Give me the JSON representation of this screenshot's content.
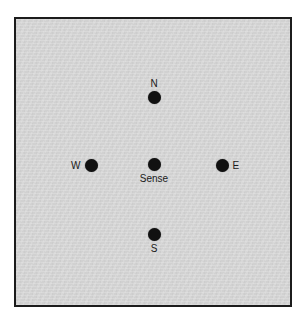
{
  "panel": {
    "background_color": "#d4d4d4",
    "border_color": "#1c1c1c",
    "page_color": "#ffffff"
  },
  "diagram": {
    "dot_color": "#111111",
    "label_color": "#1a1a1a",
    "nodes": [
      {
        "id": "north",
        "label": "N",
        "label_position": "above",
        "x": 152,
        "y": 95,
        "diameter": 13
      },
      {
        "id": "west",
        "label": "W",
        "label_position": "left",
        "x": 89,
        "y": 163,
        "diameter": 13
      },
      {
        "id": "sense",
        "label": "Sense",
        "label_position": "below",
        "x": 152,
        "y": 162,
        "diameter": 13
      },
      {
        "id": "east",
        "label": "E",
        "label_position": "right",
        "x": 220,
        "y": 163,
        "diameter": 13
      },
      {
        "id": "south",
        "label": "S",
        "label_position": "below",
        "x": 152,
        "y": 232,
        "diameter": 13
      }
    ]
  }
}
